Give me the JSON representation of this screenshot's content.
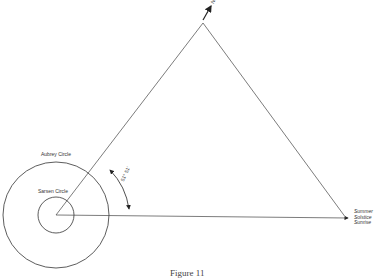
{
  "diagram": {
    "labels": {
      "north": "North",
      "aubrey_circle": "Aubrey Circle",
      "sarsen_circle": "Sarsen Circle",
      "angle": "51° 51'",
      "sunrise_line1": "Summer",
      "sunrise_line2": "Solstice",
      "sunrise_line3": "Sunrise"
    },
    "caption": "Figure 11"
  }
}
